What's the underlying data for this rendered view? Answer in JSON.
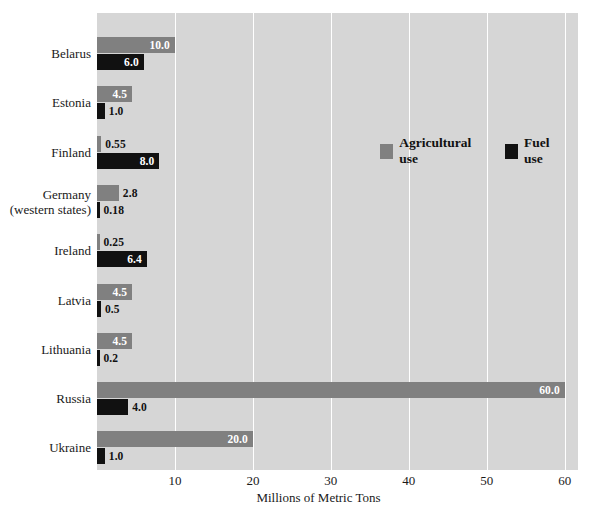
{
  "chart_data": {
    "type": "bar",
    "orientation": "horizontal",
    "title": "",
    "xlabel": "Millions of Metric Tons",
    "ylabel": "",
    "xlim": [
      0,
      61.7
    ],
    "xticks": [
      10,
      20,
      30,
      40,
      50,
      60
    ],
    "grid": "vertical-only",
    "legend_position": "inside-upper-center",
    "categories": [
      "Belarus",
      "Estonia",
      "Finland",
      "Germany (western states)",
      "Ireland",
      "Latvia",
      "Lithuania",
      "Russia",
      "Ukraine"
    ],
    "category_lines": [
      [
        "Belarus"
      ],
      [
        "Estonia"
      ],
      [
        "Finland"
      ],
      [
        "Germany",
        "(western states)"
      ],
      [
        "Ireland"
      ],
      [
        "Latvia"
      ],
      [
        "Lithuania"
      ],
      [
        "Russia"
      ],
      [
        "Ukraine"
      ]
    ],
    "series": [
      {
        "name": "Agricultural use",
        "color": "#808080",
        "values": [
          10.0,
          4.5,
          0.55,
          2.8,
          0.25,
          4.5,
          4.5,
          60.0,
          20.0
        ],
        "labels": [
          "10.0",
          "4.5",
          "0.55",
          "2.8",
          "0.25",
          "4.5",
          "4.5",
          "60.0",
          "20.0"
        ]
      },
      {
        "name": "Fuel use",
        "color": "#111111",
        "values": [
          6.0,
          1.0,
          8.0,
          0.18,
          6.4,
          0.5,
          0.2,
          4.0,
          1.0
        ],
        "labels": [
          "6.0",
          "1.0",
          "8.0",
          "0.18",
          "6.4",
          "0.5",
          "0.2",
          "4.0",
          "1.0"
        ]
      }
    ]
  },
  "axis": {
    "x_title": "Millions of Metric Tons",
    "ticks": [
      "10",
      "20",
      "30",
      "40",
      "50",
      "60"
    ]
  },
  "legend": {
    "items": [
      {
        "label": "Agricultural use",
        "color": "#808080"
      },
      {
        "label": "Fuel use",
        "color": "#111111"
      }
    ]
  },
  "colors": {
    "plot_background": "#d6d6d6",
    "gridline": "#ffffff",
    "agricultural": "#808080",
    "fuel": "#111111",
    "page_background": "#ffffff",
    "text": "#1a1a1a"
  }
}
